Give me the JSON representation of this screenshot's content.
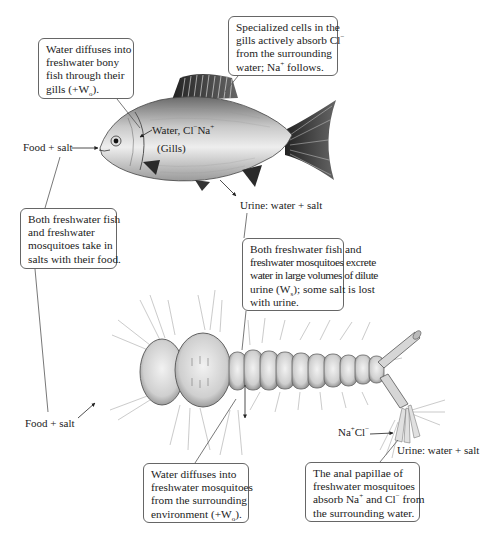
{
  "figure": {
    "callouts": {
      "fish_water_diffuses": {
        "lines": [
          "Water diffuses into",
          "freshwater bony",
          "fish through their",
          "gills (+W",
          ")."
        ],
        "subscript": "o"
      },
      "fish_specialized_cells": {
        "lines": [
          "Specialized cells in the",
          "gills actively absorb Cl",
          "from the surrounding",
          "water; Na",
          " follows."
        ],
        "superscripts": [
          "−",
          "+"
        ]
      },
      "salts_with_food": {
        "lines": [
          "Both freshwater fish",
          "and freshwater",
          "mosquitoes take in",
          "salts with their food."
        ]
      },
      "excrete_urine": {
        "lines": [
          "Both freshwater fish and",
          "freshwater mosquitoes excrete",
          "water in large volumes of dilute",
          "urine (W",
          "); some salt is lost",
          "with urine."
        ],
        "subscript": "s"
      },
      "mosquito_water_diffuses": {
        "lines": [
          "Water diffuses into",
          "freshwater mosquitoes",
          "from the surrounding",
          "environment (+W",
          ")."
        ],
        "subscript": "o"
      },
      "anal_papillae": {
        "lines": [
          "The anal papillae of",
          "freshwater mosquitoes",
          "absorb Na",
          " and Cl",
          " from",
          "the surrounding water."
        ],
        "superscripts": [
          "+",
          "−"
        ]
      }
    },
    "labels": {
      "fish_food_salt": "Food + salt",
      "fish_gill_water": "Water, Cl",
      "fish_gill_na": "Na",
      "fish_gills": "(Gills)",
      "fish_urine": "Urine: water + salt",
      "mosquito_food_salt": "Food + salt",
      "mosquito_nacl_na": "Na",
      "mosquito_nacl_cl": "Cl",
      "mosquito_urine": "Urine: water + salt",
      "sup_plus": "+",
      "sup_minus": "−"
    },
    "colors": {
      "line": "#555555",
      "box_border": "#666666",
      "text": "#222222"
    }
  }
}
